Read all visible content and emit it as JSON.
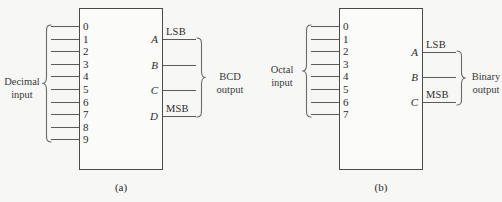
{
  "figure": {
    "background_color": "#f7f7f5",
    "line_color": "#5a5a5a",
    "text_color": "#2b2b2b"
  },
  "panels": [
    {
      "caption": "(a)",
      "input_label_line1": "Decimal",
      "input_label_line2": "input",
      "output_label_line1": "BCD",
      "output_label_line2": "output",
      "inputs": [
        "0",
        "1",
        "2",
        "3",
        "4",
        "5",
        "6",
        "7",
        "8",
        "9"
      ],
      "outputs": [
        {
          "pin": "A",
          "tag": "LSB"
        },
        {
          "pin": "B",
          "tag": ""
        },
        {
          "pin": "C",
          "tag": ""
        },
        {
          "pin": "D",
          "tag": "MSB"
        }
      ]
    },
    {
      "caption": "(b)",
      "input_label_line1": "Octal",
      "input_label_line2": "input",
      "output_label_line1": "Binary",
      "output_label_line2": "output",
      "inputs": [
        "0",
        "1",
        "2",
        "3",
        "4",
        "5",
        "6",
        "7"
      ],
      "outputs": [
        {
          "pin": "A",
          "tag": "LSB"
        },
        {
          "pin": "B",
          "tag": ""
        },
        {
          "pin": "C",
          "tag": "MSB"
        }
      ]
    }
  ]
}
